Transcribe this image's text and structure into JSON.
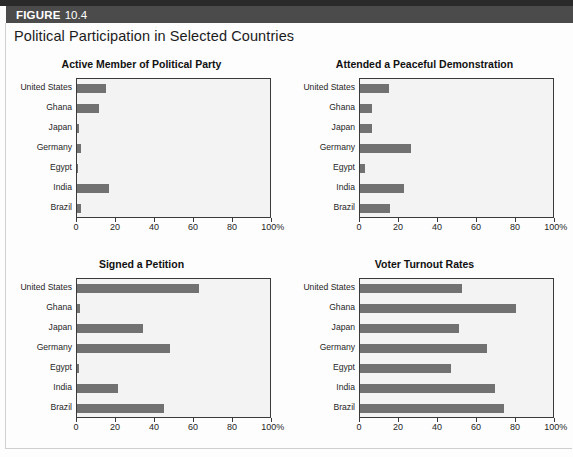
{
  "figure": {
    "label": "FIGURE",
    "number": "10.4",
    "title": "Political Participation in Selected Countries"
  },
  "palette": {
    "bar": "#717171",
    "plot_background": "#f3f3f3",
    "header_bar": "#4b4b4b",
    "axis": "#3a3a3a"
  },
  "axis": {
    "ticks": [
      0,
      20,
      40,
      60,
      80,
      100
    ],
    "tick_labels": [
      "0",
      "20",
      "40",
      "60",
      "80",
      "100%"
    ],
    "min": 0,
    "max": 100
  },
  "categories": [
    "United States",
    "Ghana",
    "Japan",
    "Germany",
    "Egypt",
    "India",
    "Brazil"
  ],
  "chart_data": [
    {
      "type": "bar",
      "title": "Active Member of Political Party",
      "orientation": "horizontal",
      "categories": [
        "United States",
        "Ghana",
        "Japan",
        "Germany",
        "Egypt",
        "India",
        "Brazil"
      ],
      "values": [
        15,
        11.5,
        1,
        2,
        0.5,
        16.5,
        2
      ],
      "xlabel": "",
      "ylabel": "",
      "xlim": [
        0,
        100
      ],
      "xticks": [
        0,
        20,
        40,
        60,
        80,
        100
      ],
      "xtick_labels": [
        "0",
        "20",
        "40",
        "60",
        "80",
        "100%"
      ],
      "grid": false,
      "legend": false
    },
    {
      "type": "bar",
      "title": "Attended a Peaceful Demonstration",
      "orientation": "horizontal",
      "categories": [
        "United States",
        "Ghana",
        "Japan",
        "Germany",
        "Egypt",
        "India",
        "Brazil"
      ],
      "values": [
        15,
        6,
        6,
        26.5,
        2.5,
        23,
        15.5
      ],
      "xlabel": "",
      "ylabel": "",
      "xlim": [
        0,
        100
      ],
      "xticks": [
        0,
        20,
        40,
        60,
        80,
        100
      ],
      "xtick_labels": [
        "0",
        "20",
        "40",
        "60",
        "80",
        "100%"
      ],
      "grid": false,
      "legend": false
    },
    {
      "type": "bar",
      "title": "Signed a Petition",
      "orientation": "horizontal",
      "categories": [
        "United States",
        "Ghana",
        "Japan",
        "Germany",
        "Egypt",
        "India",
        "Brazil"
      ],
      "values": [
        63,
        1.5,
        34,
        48,
        1,
        21.5,
        45
      ],
      "xlabel": "",
      "ylabel": "",
      "xlim": [
        0,
        100
      ],
      "xticks": [
        0,
        20,
        40,
        60,
        80,
        100
      ],
      "xtick_labels": [
        "0",
        "20",
        "40",
        "60",
        "80",
        "100%"
      ],
      "grid": false,
      "legend": false
    },
    {
      "type": "bar",
      "title": "Voter Turnout Rates",
      "orientation": "horizontal",
      "categories": [
        "United States",
        "Ghana",
        "Japan",
        "Germany",
        "Egypt",
        "India",
        "Brazil"
      ],
      "values": [
        53,
        81,
        51.5,
        66,
        47,
        70,
        74.5
      ],
      "xlabel": "",
      "ylabel": "",
      "xlim": [
        0,
        100
      ],
      "xticks": [
        0,
        20,
        40,
        60,
        80,
        100
      ],
      "xtick_labels": [
        "0",
        "20",
        "40",
        "60",
        "80",
        "100%"
      ],
      "grid": false,
      "legend": false
    }
  ]
}
